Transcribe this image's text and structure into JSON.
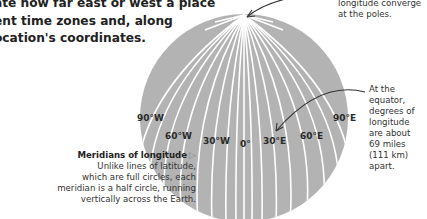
{
  "intro": {
    "lines": [
      "ate how far east or west a place",
      "ent time zones and, along",
      "ocation's coordinates."
    ]
  },
  "pole_note": {
    "lines": [
      "longitude converge",
      "at the poles."
    ]
  },
  "equator_note": {
    "lines": [
      "At the",
      "equator,",
      "degrees of",
      "longitude",
      "are about",
      "69 miles",
      "(111 km)",
      "apart."
    ]
  },
  "meridian_caption": {
    "title": "Meridians of longitude",
    "triangle": "▷",
    "lines": [
      "Unlike lines of latitude,",
      "which are full circles, each",
      "meridian is a half circle, running",
      "vertically across the Earth."
    ]
  },
  "meridian_labels": [
    {
      "text": "90°W",
      "x": 136,
      "y": 120
    },
    {
      "text": "60°W",
      "x": 164,
      "y": 131
    },
    {
      "text": "30°W",
      "x": 203,
      "y": 137
    },
    {
      "text": "0°",
      "x": 240,
      "y": 141
    },
    {
      "text": "30°E",
      "x": 263,
      "y": 137
    },
    {
      "text": "60°E",
      "x": 300,
      "y": 131
    },
    {
      "text": "90°E",
      "x": 334,
      "y": 120
    }
  ],
  "colors": {
    "globe": "#b3b3b3",
    "meridian": "#ffffff",
    "arrow": "#333333"
  }
}
